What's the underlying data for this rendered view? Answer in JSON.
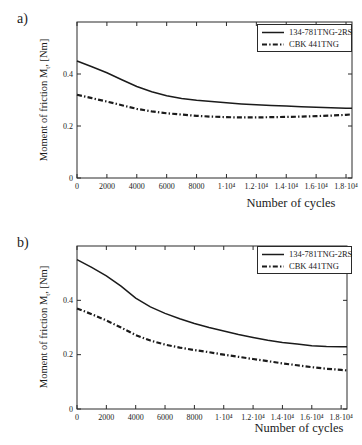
{
  "colors": {
    "line": "#1b1b1b",
    "axis": "#2a2a2a",
    "background": "#ffffff"
  },
  "charts": [
    {
      "panel_label": "a)",
      "ylabel": {
        "pre": "Moment of friction M",
        "sub": "t",
        "post": ", [Nm]"
      },
      "xlabel": "Number of cycles",
      "legend": [
        {
          "label": "134-781TNG-2RS",
          "style": "solid"
        },
        {
          "label": "CBK 441TNG",
          "style": "dashdot"
        }
      ]
    },
    {
      "panel_label": "b)",
      "ylabel": {
        "pre": "Moment of friction M",
        "sub": "t",
        "post": ", [Nm]"
      },
      "xlabel": "Number of cycles",
      "legend": [
        {
          "label": "134-781TNG-2RS",
          "style": "solid"
        },
        {
          "label": "CBK 441TNG",
          "style": "dashdot"
        }
      ]
    }
  ],
  "chart_data": [
    {
      "type": "line",
      "title": "",
      "xlabel": "Number of cycles",
      "ylabel": "Moment of friction Mt, [Nm]",
      "xlim": [
        0,
        18400
      ],
      "ylim": [
        0,
        0.6
      ],
      "grid": false,
      "legend_position": "top-right",
      "x_ticks": {
        "values": [
          0,
          2000,
          4000,
          6000,
          8000,
          10000,
          12000,
          14000,
          16000,
          18000
        ],
        "labels": [
          "0",
          "2000",
          "4000",
          "6000",
          "8000",
          "1·10⁴",
          "1.2·10⁴",
          "1.4·10⁴",
          "1.6·10⁴",
          "1.8·10⁴"
        ]
      },
      "y_ticks": {
        "values": [
          0,
          0.2,
          0.4
        ],
        "labels": [
          "0",
          "0.2",
          "0.4"
        ]
      },
      "x": [
        0,
        1000,
        2000,
        3000,
        4000,
        5000,
        6000,
        7000,
        8000,
        9000,
        10000,
        11000,
        12000,
        13000,
        14000,
        15000,
        16000,
        17000,
        18000,
        18400
      ],
      "series": [
        {
          "name": "134-781TNG-2RS",
          "style": "solid",
          "values": [
            0.45,
            0.428,
            0.405,
            0.378,
            0.352,
            0.332,
            0.316,
            0.306,
            0.299,
            0.294,
            0.289,
            0.285,
            0.282,
            0.279,
            0.277,
            0.274,
            0.272,
            0.27,
            0.268,
            0.268
          ]
        },
        {
          "name": "CBK 441TNG",
          "style": "dashdot",
          "values": [
            0.32,
            0.307,
            0.294,
            0.28,
            0.266,
            0.256,
            0.249,
            0.244,
            0.239,
            0.236,
            0.234,
            0.233,
            0.233,
            0.234,
            0.235,
            0.236,
            0.238,
            0.24,
            0.243,
            0.245
          ]
        }
      ]
    },
    {
      "type": "line",
      "title": "",
      "xlabel": "Number of cycles",
      "ylabel": "Moment of friction Mt, [Nm]",
      "xlim": [
        0,
        18400
      ],
      "ylim": [
        0,
        0.6
      ],
      "grid": false,
      "legend_position": "top-right",
      "x_ticks": {
        "values": [
          0,
          2000,
          4000,
          6000,
          8000,
          10000,
          12000,
          14000,
          16000,
          18000
        ],
        "labels": [
          "0",
          "2000",
          "4000",
          "6000",
          "8000",
          "1·10⁴",
          "1.2·10⁴",
          "1.4·10⁴",
          "1.6·10⁴",
          "1.8·10⁴"
        ]
      },
      "y_ticks": {
        "values": [
          0,
          0.2,
          0.4
        ],
        "labels": [
          "0",
          "0.2",
          "0.4"
        ]
      },
      "x": [
        0,
        1000,
        2000,
        3000,
        4000,
        5000,
        6000,
        7000,
        8000,
        9000,
        10000,
        11000,
        12000,
        13000,
        14000,
        15000,
        16000,
        17000,
        18000,
        18400
      ],
      "series": [
        {
          "name": "134-781TNG-2RS",
          "style": "solid",
          "values": [
            0.55,
            0.521,
            0.49,
            0.452,
            0.408,
            0.376,
            0.352,
            0.332,
            0.315,
            0.3,
            0.287,
            0.274,
            0.263,
            0.253,
            0.245,
            0.239,
            0.233,
            0.23,
            0.229,
            0.229
          ]
        },
        {
          "name": "CBK 441TNG",
          "style": "dashdot",
          "values": [
            0.37,
            0.349,
            0.326,
            0.3,
            0.272,
            0.252,
            0.237,
            0.226,
            0.217,
            0.209,
            0.2,
            0.192,
            0.184,
            0.176,
            0.168,
            0.161,
            0.154,
            0.148,
            0.144,
            0.142
          ]
        }
      ]
    }
  ]
}
